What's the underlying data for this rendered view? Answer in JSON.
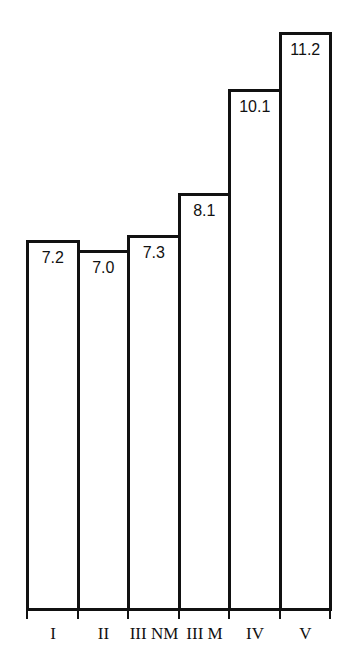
{
  "chart_data": {
    "type": "bar",
    "title": "",
    "xlabel": "",
    "ylabel": "",
    "categories": [
      "I",
      "II",
      "III NM",
      "III M",
      "IV",
      "V"
    ],
    "values": [
      7.2,
      7.0,
      7.3,
      8.1,
      10.1,
      11.2
    ],
    "value_labels": [
      "7.2",
      "7.0",
      "7.3",
      "8.1",
      "10.1",
      "11.2"
    ],
    "grid": false,
    "legend": null,
    "bar_fill": "#ffffff",
    "bar_stroke": "#111111"
  }
}
